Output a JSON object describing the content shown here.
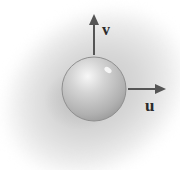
{
  "diagram": {
    "vectors": [
      {
        "label": "v",
        "direction": "up"
      },
      {
        "label": "u",
        "direction": "right"
      }
    ],
    "colors": {
      "background_blob": "#cfcfcf",
      "sphere_light": "#f5f5f5",
      "sphere_dark": "#9a9a9a",
      "arrow": "#555555",
      "label": "#2b2b2b"
    }
  }
}
